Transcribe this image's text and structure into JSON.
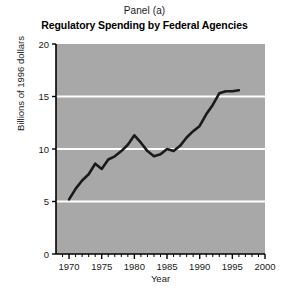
{
  "figure": {
    "panel_label": "Panel (a)",
    "title": "Regulatory Spending by Federal Agencies",
    "xlabel": "Year",
    "ylabel": "Billions of 1996 dollars",
    "plot_bg_color": "#a8a8a8",
    "gridline_color": "#ffffff",
    "line_color": "#1a1a1a",
    "axis_color": "#000000",
    "page_bg_color": "#ffffff"
  },
  "axes": {
    "y_ticks": [
      "0",
      "5",
      "10",
      "15",
      "20"
    ],
    "x_ticks": [
      "1970",
      "1975",
      "1980",
      "1985",
      "1990",
      "1995",
      "2000"
    ],
    "y_gridlines": [
      5,
      10,
      15
    ],
    "x_minor_tick_step": 1,
    "y_minor_ticks": false
  },
  "chart_data": {
    "type": "line",
    "title": "Regulatory Spending by Federal Agencies",
    "subtitle": "Panel (a)",
    "xlabel": "Year",
    "ylabel": "Billions of 1996 dollars",
    "xlim": [
      1968,
      2000
    ],
    "ylim": [
      0,
      20
    ],
    "yticks": [
      0,
      5,
      10,
      15,
      20
    ],
    "xticks": [
      1970,
      1975,
      1980,
      1985,
      1990,
      1995,
      2000
    ],
    "grid": "horizontal-only",
    "legend": "none",
    "series": [
      {
        "name": "Regulatory spending",
        "x": [
          1970,
          1971,
          1972,
          1973,
          1974,
          1975,
          1976,
          1977,
          1978,
          1979,
          1980,
          1981,
          1982,
          1983,
          1984,
          1985,
          1986,
          1987,
          1988,
          1989,
          1990,
          1991,
          1992,
          1993,
          1994,
          1995,
          1996
        ],
        "values": [
          5.2,
          6.2,
          7.0,
          7.6,
          8.6,
          8.1,
          9.0,
          9.3,
          9.8,
          10.4,
          11.3,
          10.6,
          9.8,
          9.3,
          9.5,
          10.0,
          9.8,
          10.3,
          11.1,
          11.7,
          12.2,
          13.3,
          14.2,
          15.3,
          15.5,
          15.5,
          15.6
        ]
      }
    ]
  }
}
